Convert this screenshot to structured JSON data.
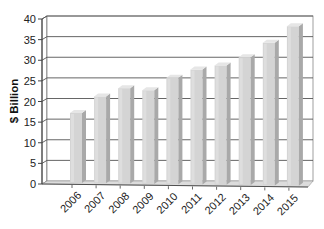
{
  "chart_data": {
    "type": "bar",
    "style": "3d-column",
    "title": "",
    "xlabel": "",
    "ylabel": "$ Billion",
    "categories": [
      "2006",
      "2007",
      "2008",
      "2009",
      "2010",
      "2011",
      "2012",
      "2013",
      "2014",
      "2015"
    ],
    "values": [
      17,
      21,
      23,
      22.5,
      25.5,
      27.5,
      28.5,
      30.5,
      34,
      38
    ],
    "ylim": [
      0,
      40
    ],
    "yticks": [
      0,
      5,
      10,
      15,
      20,
      25,
      30,
      35,
      40
    ],
    "grid": true,
    "legend": null,
    "colors": {
      "bar_front": "#d4d4d4",
      "bar_side": "#a9a9a9",
      "bar_top": "#e6e6e6",
      "gridline": "#555555",
      "floor": "#dcdcdc",
      "axis": "#444444"
    }
  }
}
